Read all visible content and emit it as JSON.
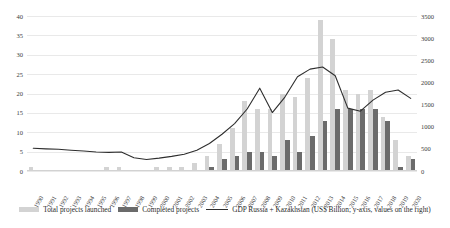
{
  "chart_data": {
    "type": "bar",
    "title": "",
    "subtitle": "",
    "xlabel": "",
    "ylabel": "",
    "y2label": "GDP Russia + Kazakhstan (US$ Billion)",
    "grid": true,
    "legend_position": "bottom",
    "ylim": [
      0,
      40
    ],
    "y2lim": [
      0,
      3500
    ],
    "yticks": [
      "0",
      "5",
      "10",
      "15",
      "20",
      "25",
      "30",
      "35",
      "40"
    ],
    "y2ticks": [
      "0",
      "500",
      "1000",
      "1500",
      "2000",
      "2500",
      "3000",
      "3500"
    ],
    "categories": [
      "1990",
      "1991",
      "1992",
      "1993",
      "1994",
      "1995",
      "1996",
      "1997",
      "1998",
      "1999",
      "2000",
      "2001",
      "2002",
      "2003",
      "2004",
      "2005",
      "2006",
      "2007",
      "2008",
      "2009",
      "2010",
      "2011",
      "2012",
      "2013",
      "2014",
      "2015",
      "2016",
      "2017",
      "2018",
      "2019",
      "2020"
    ],
    "series": [
      {
        "name": "Total projects launched",
        "type": "bar",
        "axis": "left",
        "color": "#d3d3d3",
        "values": [
          1,
          0,
          0,
          0,
          0,
          0,
          1,
          1,
          0,
          0,
          1,
          1,
          1,
          2,
          4,
          7,
          11,
          18,
          16,
          16,
          20,
          19,
          24,
          39,
          34,
          21,
          20,
          21,
          14,
          8,
          4
        ]
      },
      {
        "name": "Completed projects",
        "type": "bar",
        "axis": "left",
        "color": "#6b6b6b",
        "values": [
          0,
          0,
          0,
          0,
          0,
          0,
          0,
          0,
          0,
          0,
          0,
          0,
          0,
          0,
          1,
          3,
          4,
          5,
          5,
          4,
          8,
          5,
          9,
          13,
          16,
          16,
          16,
          16,
          13,
          1,
          3
        ]
      },
      {
        "name": "GDP Russia + Kazakhstan (US$ Billion; y-axis, values on the right)",
        "type": "line",
        "axis": "right",
        "color": "#2e2e2e",
        "values": [
          515,
          500,
          490,
          470,
          450,
          430,
          420,
          430,
          300,
          260,
          290,
          330,
          380,
          470,
          620,
          830,
          1070,
          1400,
          1870,
          1320,
          1670,
          2130,
          2300,
          2350,
          2150,
          1420,
          1350,
          1600,
          1780,
          1830,
          1640
        ]
      }
    ],
    "legend": [
      {
        "label": "Total projects launched",
        "swatch": "bar-light",
        "color": "#d3d3d3"
      },
      {
        "label": "Completed projects",
        "swatch": "bar-dark",
        "color": "#6b6b6b"
      },
      {
        "label": "GDP Russia + Kazakhstan (US$ Billion; y-axis, values on the right)",
        "swatch": "line",
        "color": "#2e2e2e"
      }
    ]
  }
}
